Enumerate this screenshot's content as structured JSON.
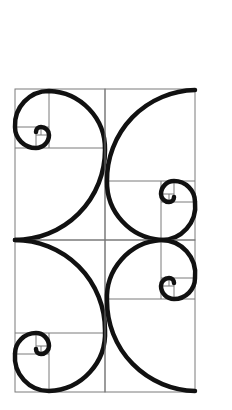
{
  "diagram": {
    "outer_rect": {
      "x": 15,
      "y": 89,
      "width": 180,
      "height": 303
    },
    "quadrants": [
      {
        "name": "top-left",
        "x": 15,
        "y": 89,
        "w": 90,
        "h": 151,
        "spiral_eye": "upper-left"
      },
      {
        "name": "top-right",
        "x": 105,
        "y": 89,
        "w": 90,
        "h": 151,
        "spiral_eye": "lower-right"
      },
      {
        "name": "bottom-left",
        "x": 15,
        "y": 240,
        "w": 90,
        "h": 152,
        "spiral_eye": "lower-left"
      },
      {
        "name": "bottom-right",
        "x": 105,
        "y": 240,
        "w": 90,
        "h": 152,
        "spiral_eye": "upper-right"
      }
    ],
    "colors": {
      "grid": "#7a7a7a",
      "spiral": "#111111",
      "background": "#ffffff"
    }
  }
}
